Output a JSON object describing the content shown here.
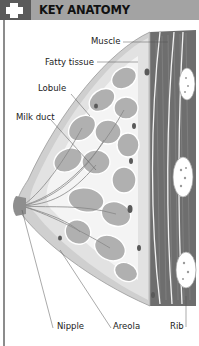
{
  "header": {
    "title": "KEY ANATOMY",
    "icon": "plus-cross-icon",
    "background_color": "#a3a3a3",
    "icon_box_color": "#5a5a5a"
  },
  "diagram": {
    "labels": {
      "muscle": "Muscle",
      "fatty_tissue": "Fatty tissue",
      "lobule": "Lobule",
      "milk_duct": "Milk duct",
      "nipple": "Nipple",
      "areola": "Areola",
      "rib": "Rib"
    },
    "colors": {
      "muscle": "#6e6e6e",
      "lobule": "#b0b0b0",
      "fatty_tissue": "#dcdcdc",
      "skin": "#c8c8c8",
      "rib": "#ffffff",
      "leader_line": "#555555"
    }
  }
}
